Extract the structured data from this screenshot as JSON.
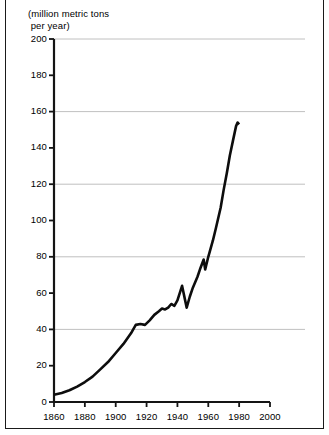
{
  "figure": {
    "axis_caption_line1": "(million metric tons",
    "axis_caption_line2": " per year)",
    "line_color": "#0d0d0d",
    "grid_color": "#b9b9b9",
    "axis_color": "#141414",
    "background": "#ffffff"
  },
  "chart_data": {
    "type": "line",
    "title": "",
    "subtitle": "",
    "xlabel": "",
    "ylabel": "(million metric tons per year)",
    "xlim": [
      1860,
      2000
    ],
    "ylim": [
      0,
      200
    ],
    "xticks": [
      1860,
      1880,
      1900,
      1920,
      1940,
      1960,
      1980,
      2000
    ],
    "xtick_labels": [
      "1860",
      "1880",
      "1900",
      "1920",
      "1940",
      "1960",
      "1980",
      "2000"
    ],
    "yticks": [
      0,
      20,
      40,
      60,
      80,
      100,
      120,
      140,
      160,
      180,
      200
    ],
    "ytick_labels": [
      "0",
      "20",
      "40",
      "60",
      "80",
      "100",
      "120",
      "140",
      "160",
      "180",
      "200"
    ],
    "gridlines_y": [
      40,
      80,
      120,
      160,
      200
    ],
    "grid": "horizontal-major",
    "legend": "none",
    "annotations": [],
    "series": [
      {
        "name": "production",
        "x": [
          1860,
          1865,
          1870,
          1875,
          1880,
          1885,
          1890,
          1895,
          1900,
          1905,
          1910,
          1913,
          1916,
          1919,
          1922,
          1925,
          1928,
          1930,
          1932,
          1934,
          1936,
          1938,
          1940,
          1943,
          1945,
          1946,
          1948,
          1950,
          1953,
          1955,
          1957,
          1958,
          1960,
          1963,
          1965,
          1968,
          1970,
          1972,
          1974,
          1976,
          1978,
          1979,
          1980
        ],
        "y": [
          4,
          5,
          6.5,
          8.5,
          11,
          14,
          18,
          22,
          27,
          32,
          38,
          42.5,
          43,
          42.5,
          45,
          48,
          50,
          51.5,
          51,
          52,
          54,
          53,
          56,
          64,
          56,
          52,
          58,
          63,
          69,
          74,
          78.5,
          73,
          80,
          89,
          96,
          107,
          117,
          126,
          136,
          144,
          152,
          154,
          153
        ]
      }
    ]
  }
}
